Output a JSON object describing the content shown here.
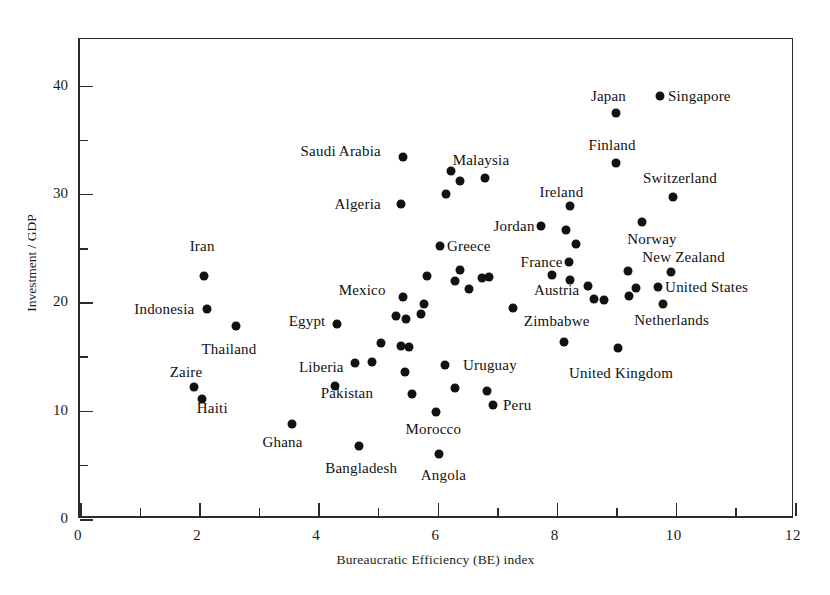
{
  "chart_data": {
    "type": "scatter",
    "title": "",
    "xlabel": "Bureaucratic Efficiency (BE) index",
    "ylabel": "Investment / GDP",
    "xlim": [
      0,
      12
    ],
    "ylim": [
      0,
      44.3
    ],
    "grid": false,
    "legend": null,
    "xticks_major": [
      0,
      2,
      4,
      6,
      8,
      10,
      12
    ],
    "xticks_minor": [
      1,
      3,
      5,
      7,
      9,
      11
    ],
    "yticks_major": [
      0,
      10,
      20,
      30,
      40
    ],
    "yticks_minor": [
      5,
      15,
      25,
      35
    ],
    "xtick_labels": [
      "0",
      "2",
      "4",
      "6",
      "8",
      "10",
      "12"
    ],
    "ytick_labels": [
      "0",
      "10",
      "20",
      "30",
      "40"
    ],
    "marker": "filled-circle",
    "marker_color": "#121212",
    "points": [
      {
        "label": "Iran",
        "x": 2.08,
        "y": 22.4,
        "lx": 2.05,
        "ly": 25.2,
        "anchor": "c"
      },
      {
        "label": "Indonesia",
        "x": 2.13,
        "y": 19.4,
        "lx": 1.92,
        "ly": 19.4,
        "anchor": "r"
      },
      {
        "label": "Thailand",
        "x": 2.62,
        "y": 17.8,
        "lx": 2.5,
        "ly": 15.7,
        "anchor": "c"
      },
      {
        "label": "Zaire",
        "x": 1.92,
        "y": 12.2,
        "lx": 1.78,
        "ly": 13.6,
        "anchor": "c"
      },
      {
        "label": "Haiti",
        "x": 2.05,
        "y": 11.1,
        "lx": 2.22,
        "ly": 10.2,
        "anchor": "c"
      },
      {
        "label": "Ghana",
        "x": 3.55,
        "y": 8.8,
        "lx": 3.4,
        "ly": 7.1,
        "anchor": "c"
      },
      {
        "label": "Liberia",
        "x": 4.28,
        "y": 12.3,
        "lx": 4.05,
        "ly": 14.0,
        "anchor": "c"
      },
      {
        "label": "Egypt",
        "x": 4.32,
        "y": 18.0,
        "lx": 4.12,
        "ly": 18.3,
        "anchor": "r"
      },
      {
        "label": "Pakistan",
        "x": 4.62,
        "y": 14.4,
        "lx": 4.48,
        "ly": 11.6,
        "anchor": "c"
      },
      {
        "label": "Bangladesh",
        "x": 4.68,
        "y": 6.7,
        "lx": 4.72,
        "ly": 4.7,
        "anchor": "c"
      },
      {
        "label": "Mexico",
        "x": 5.42,
        "y": 20.5,
        "lx": 5.13,
        "ly": 21.1,
        "anchor": "r"
      },
      {
        "label": "Saudi Arabia",
        "x": 5.42,
        "y": 33.4,
        "lx": 5.05,
        "ly": 34.0,
        "anchor": "r"
      },
      {
        "label": "Algeria",
        "x": 5.38,
        "y": 29.1,
        "lx": 5.05,
        "ly": 29.1,
        "anchor": "r"
      },
      {
        "label": "Greece",
        "x": 6.05,
        "y": 25.2,
        "lx": 6.16,
        "ly": 25.2,
        "anchor": "l"
      },
      {
        "label": "Malaysia",
        "x": 6.8,
        "y": 31.5,
        "lx": 6.73,
        "ly": 33.1,
        "anchor": "c"
      },
      {
        "label": "Jordan",
        "x": 7.73,
        "y": 27.0,
        "lx": 7.63,
        "ly": 27.0,
        "anchor": "r"
      },
      {
        "label": "France",
        "x": 8.2,
        "y": 23.7,
        "lx": 8.1,
        "ly": 23.7,
        "anchor": "r"
      },
      {
        "label": "Austria",
        "x": 8.22,
        "y": 22.1,
        "lx": 8.0,
        "ly": 21.1,
        "anchor": "c"
      },
      {
        "label": "Ireland",
        "x": 8.23,
        "y": 28.9,
        "lx": 8.08,
        "ly": 30.2,
        "anchor": "c"
      },
      {
        "label": "Finland",
        "x": 9.0,
        "y": 32.9,
        "lx": 8.93,
        "ly": 34.5,
        "anchor": "c"
      },
      {
        "label": "Japan",
        "x": 9.0,
        "y": 37.5,
        "lx": 8.87,
        "ly": 39.0,
        "anchor": "c"
      },
      {
        "label": "Singapore",
        "x": 9.73,
        "y": 39.0,
        "lx": 9.87,
        "ly": 39.0,
        "anchor": "l"
      },
      {
        "label": "Switzerland",
        "x": 9.95,
        "y": 29.7,
        "lx": 10.07,
        "ly": 31.5,
        "anchor": "c"
      },
      {
        "label": "Norway",
        "x": 9.43,
        "y": 27.4,
        "lx": 9.6,
        "ly": 25.8,
        "anchor": "c"
      },
      {
        "label": "New Zealand",
        "x": 9.92,
        "y": 22.8,
        "lx": 10.13,
        "ly": 24.2,
        "anchor": "c"
      },
      {
        "label": "United States",
        "x": 9.7,
        "y": 21.4,
        "lx": 9.82,
        "ly": 21.4,
        "anchor": "l"
      },
      {
        "label": "Netherlands",
        "x": 9.78,
        "y": 19.8,
        "lx": 9.93,
        "ly": 18.4,
        "anchor": "c"
      },
      {
        "label": "United Kingdom",
        "x": 9.03,
        "y": 15.8,
        "lx": 9.08,
        "ly": 13.5,
        "anchor": "c"
      },
      {
        "label": "Zimbabwe",
        "x": 8.13,
        "y": 16.3,
        "lx": 8.0,
        "ly": 18.3,
        "anchor": "c"
      },
      {
        "label": "Uruguay",
        "x": 6.93,
        "y": 10.5,
        "lx": 6.88,
        "ly": 14.2,
        "anchor": "c"
      },
      {
        "label": "Peru",
        "x": 6.83,
        "y": 11.8,
        "lx": 7.1,
        "ly": 10.5,
        "anchor": "l"
      },
      {
        "label": "Morocco",
        "x": 5.97,
        "y": 9.9,
        "lx": 5.93,
        "ly": 8.3,
        "anchor": "c"
      },
      {
        "label": "Angola",
        "x": 6.03,
        "y": 6.0,
        "lx": 6.1,
        "ly": 4.1,
        "anchor": "c"
      }
    ],
    "unlabeled_points": [
      {
        "x": 6.22,
        "y": 32.1
      },
      {
        "x": 6.38,
        "y": 31.2
      },
      {
        "x": 6.15,
        "y": 30.0
      },
      {
        "x": 6.38,
        "y": 23.0
      },
      {
        "x": 6.3,
        "y": 22.0
      },
      {
        "x": 6.75,
        "y": 22.2
      },
      {
        "x": 6.53,
        "y": 21.2
      },
      {
        "x": 6.87,
        "y": 22.3
      },
      {
        "x": 5.82,
        "y": 22.4
      },
      {
        "x": 5.78,
        "y": 19.8
      },
      {
        "x": 5.3,
        "y": 18.7
      },
      {
        "x": 5.47,
        "y": 18.5
      },
      {
        "x": 5.72,
        "y": 18.9
      },
      {
        "x": 5.05,
        "y": 16.2
      },
      {
        "x": 5.38,
        "y": 16.0
      },
      {
        "x": 5.52,
        "y": 15.9
      },
      {
        "x": 4.9,
        "y": 14.5
      },
      {
        "x": 5.45,
        "y": 13.6
      },
      {
        "x": 6.12,
        "y": 14.2
      },
      {
        "x": 6.3,
        "y": 12.1
      },
      {
        "x": 5.58,
        "y": 11.5
      },
      {
        "x": 7.27,
        "y": 19.5
      },
      {
        "x": 7.92,
        "y": 22.5
      },
      {
        "x": 8.32,
        "y": 25.4
      },
      {
        "x": 8.15,
        "y": 26.7
      },
      {
        "x": 8.53,
        "y": 21.5
      },
      {
        "x": 8.62,
        "y": 20.3
      },
      {
        "x": 8.8,
        "y": 20.2
      },
      {
        "x": 9.2,
        "y": 22.9
      },
      {
        "x": 9.22,
        "y": 20.6
      },
      {
        "x": 9.33,
        "y": 21.3
      }
    ]
  },
  "axis": {
    "x_title": "Bureaucratic Efficiency (BE) index",
    "y_title": "Investment / GDP"
  }
}
